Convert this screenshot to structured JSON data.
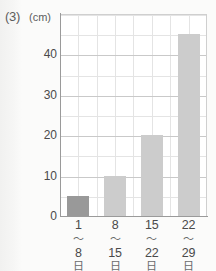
{
  "question_label": "(3)",
  "unit_label": "(cm)",
  "chart_data": {
    "type": "bar",
    "title": "",
    "xlabel": "",
    "ylabel": "(cm)",
    "ylim": [
      0,
      50
    ],
    "yticks": [
      0,
      10,
      20,
      30,
      40
    ],
    "yminor_step": 5,
    "grid": true,
    "legend": "none",
    "categories": [
      "1〜8日",
      "8〜15日",
      "15〜22日",
      "22〜29日"
    ],
    "category_parts": [
      {
        "start": "1",
        "sep": "〜",
        "end": "8",
        "day": "日"
      },
      {
        "start": "8",
        "sep": "〜",
        "end": "15",
        "day": "日"
      },
      {
        "start": "15",
        "sep": "〜",
        "end": "22",
        "day": "日"
      },
      {
        "start": "22",
        "sep": "〜",
        "end": "29",
        "day": "日"
      }
    ],
    "values": [
      5,
      10,
      20,
      45
    ],
    "bar_colors": [
      "#999999",
      "#cccccc",
      "#cccccc",
      "#cccccc"
    ],
    "highlight_index": 0
  },
  "colors": {
    "bar_highlight": "#999999",
    "bar_default": "#cccccc",
    "grid_minor": "#e4e4e4",
    "grid_major": "#c9c9c9",
    "axis": "#9a9a9a",
    "text": "#4a4a4a",
    "background": "#fbfbfa"
  }
}
